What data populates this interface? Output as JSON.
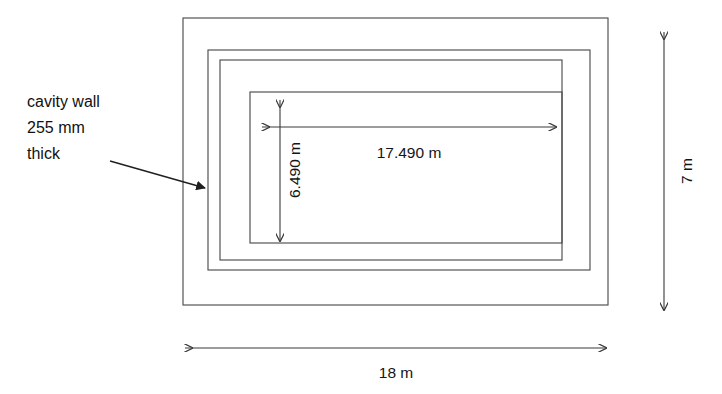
{
  "diagram": {
    "annotation": {
      "name": "cavity-wall-note",
      "lines": [
        "cavity wall",
        "255 mm",
        "thick"
      ],
      "line1": "cavity wall",
      "line2": "255 mm",
      "line3": "thick"
    },
    "dimensions": {
      "internal_length": "17.490 m",
      "internal_width": "6.490 m",
      "overall_height": "7 m",
      "overall_width": "18 m"
    },
    "colors": {
      "outline": "#4d4d4d",
      "dimension": "#3a3a3a",
      "leader": "#1f1f1f",
      "background": "#ffffff",
      "text": "#151515"
    },
    "rectangles": [
      {
        "name": "outer-boundary",
        "x": 183,
        "y": 18,
        "width": 425,
        "height": 287
      },
      {
        "name": "cavity-wall-outer-leaf",
        "x": 208,
        "y": 50,
        "width": 382,
        "height": 220
      },
      {
        "name": "cavity-wall-inner-leaf",
        "x": 220,
        "y": 60,
        "width": 380,
        "height": 220
      },
      {
        "name": "internal-room",
        "x": 250,
        "y": 92,
        "width": 312,
        "height": 151
      }
    ]
  }
}
